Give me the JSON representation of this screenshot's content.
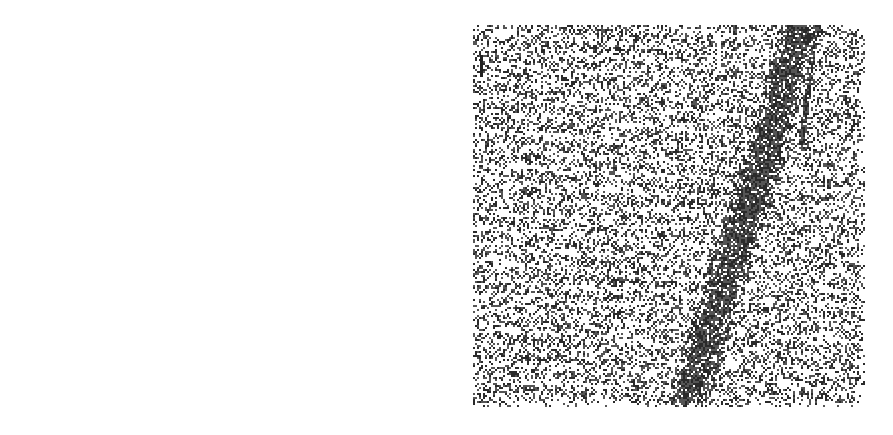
{
  "figure": {
    "width": 893,
    "height": 435,
    "background": "#ffffff",
    "panels": [
      {
        "id": "left",
        "kind": "atomistic-scatter",
        "description": "Scatter of dots in slanted band with dark central dislocation line",
        "region": {
          "x": 0,
          "y": 0,
          "w": 446,
          "h": 435
        },
        "polygon": [
          [
            35,
            32
          ],
          [
            268,
            28
          ],
          [
            410,
            268
          ],
          [
            412,
            405
          ],
          [
            185,
            408
          ]
        ],
        "dot_color": "#111111",
        "defect_line": [
          [
            246,
            120
          ],
          [
            232,
            180
          ],
          [
            218,
            230
          ],
          [
            206,
            290
          ],
          [
            195,
            340
          ]
        ],
        "streak_angle_deg": 30
      },
      {
        "id": "right",
        "kind": "dithered-micrograph",
        "description": "Dithered grayscale texture with dark diagonal band",
        "region": {
          "x": 473,
          "y": 25,
          "w": 391,
          "h": 381
        },
        "ink_color": "#333333",
        "band": [
          [
            800,
            25
          ],
          [
            780,
            100
          ],
          [
            750,
            200
          ],
          [
            718,
            300
          ],
          [
            685,
            405
          ]
        ],
        "side_strand": [
          [
            815,
            25
          ],
          [
            808,
            80
          ],
          [
            800,
            145
          ]
        ]
      }
    ]
  }
}
